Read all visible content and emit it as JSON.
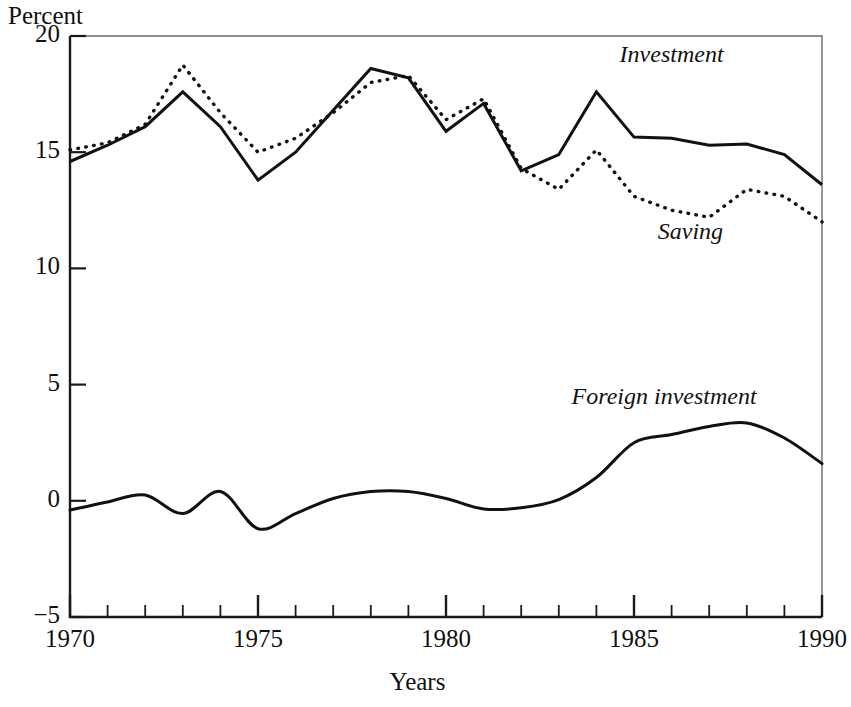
{
  "chart_data": {
    "type": "line",
    "title": "",
    "xlabel": "Years",
    "ylabel": "Percent",
    "xlim": [
      1970,
      1990
    ],
    "ylim": [
      -5,
      20
    ],
    "grid": false,
    "legend_position": "inline-annotations",
    "x": [
      1970,
      1971,
      1972,
      1973,
      1974,
      1975,
      1976,
      1977,
      1978,
      1979,
      1980,
      1981,
      1982,
      1983,
      1984,
      1985,
      1986,
      1987,
      1988,
      1989,
      1990
    ],
    "xticks": [
      "1970",
      "1975",
      "1980",
      "1985",
      "1990"
    ],
    "xtick_values": [
      1970,
      1975,
      1980,
      1985,
      1990
    ],
    "yticks": [
      "20",
      "15",
      "10",
      "5",
      "0",
      "−5"
    ],
    "ytick_values": [
      20,
      15,
      10,
      5,
      0,
      -5
    ],
    "minor_xticks": true,
    "series": [
      {
        "name": "Investment",
        "style": "solid",
        "color": "#111111",
        "values": [
          14.6,
          15.3,
          16.1,
          17.6,
          16.1,
          13.8,
          15.0,
          16.8,
          18.6,
          18.2,
          15.9,
          17.1,
          14.2,
          14.9,
          17.6,
          15.65,
          15.6,
          15.3,
          15.35,
          14.9,
          13.6
        ]
      },
      {
        "name": "Saving",
        "style": "dotted",
        "color": "#111111",
        "values": [
          15.1,
          15.4,
          16.2,
          18.75,
          16.7,
          15.0,
          15.6,
          16.7,
          18.0,
          18.3,
          16.4,
          17.3,
          14.3,
          13.4,
          15.1,
          13.1,
          12.5,
          12.2,
          13.4,
          13.1,
          12.0
        ]
      },
      {
        "name": "Foreign investment",
        "style": "solid",
        "color": "#111111",
        "values": [
          -0.4,
          -0.05,
          0.25,
          -0.1,
          -0.6,
          0.4,
          -1.2,
          -0.55,
          0.1,
          0.4,
          0.4,
          0.1,
          -0.35,
          -0.3,
          0.05,
          1.0,
          2.5,
          2.85,
          3.1,
          3.35,
          2.7
        ]
      }
    ],
    "foreign_investment_x": [
      1970,
      1971,
      1972,
      1973,
      1974,
      1975,
      1976,
      1977,
      1978,
      1979,
      1980,
      1981,
      1982,
      1983,
      1984,
      1985,
      1986,
      1987,
      1988,
      1989,
      1990
    ],
    "foreign_investment_values": [
      -0.4,
      -0.05,
      0.25,
      -0.55,
      0.4,
      -1.2,
      -0.55,
      0.1,
      0.4,
      0.4,
      0.1,
      -0.35,
      -0.3,
      0.05,
      1.0,
      2.5,
      2.85,
      3.2,
      3.35,
      2.7,
      1.6
    ],
    "annotations": [
      {
        "text": "Investment",
        "x": 1986.0,
        "y": 19.1
      },
      {
        "text": "Saving",
        "x": 1986.5,
        "y": 11.5
      },
      {
        "text": "Foreign investment",
        "x": 1985.8,
        "y": 4.4
      }
    ]
  },
  "labels": {
    "y_axis_title": "Percent",
    "x_axis_title": "Years",
    "investment": "Investment",
    "saving": "Saving",
    "foreign_investment": "Foreign investment"
  }
}
